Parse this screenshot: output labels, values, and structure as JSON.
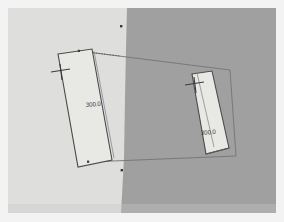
{
  "viewport": {
    "name": "3d-measurement-viewport",
    "background_left_color": "#dededc",
    "background_right_color": "#a0a0a0",
    "frame_color": "#ffffff",
    "split_label": "model-background-split"
  },
  "scene": {
    "wireframe_color": "#6e6e72",
    "panel_fill_color": "#e8e8e4",
    "panel_edge_color": "#4a4a4c",
    "vertex_color": "#3a3a3a",
    "tick_color": "#3c3c3e"
  },
  "measurements": [
    {
      "id": "left-panel",
      "label": "300.0",
      "icon": "dimension-tick-icon"
    },
    {
      "id": "right-panel",
      "label": "300.0",
      "icon": "dimension-tick-icon"
    }
  ],
  "vertices": [
    {
      "id": "vertex-top",
      "name": "vertex-marker-top"
    },
    {
      "id": "vertex-bottom",
      "name": "vertex-marker-bottom"
    },
    {
      "id": "vertex-panel-top-left",
      "name": "vertex-marker-panel-top-left"
    },
    {
      "id": "vertex-panel-bottom-left",
      "name": "vertex-marker-panel-bottom-left"
    }
  ]
}
